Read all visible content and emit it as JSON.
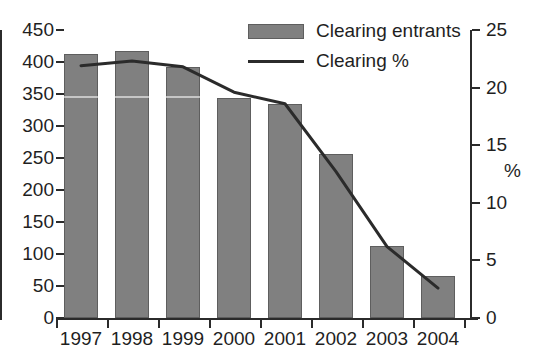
{
  "chart_data": {
    "type": "bar",
    "title": "",
    "subtitle": "",
    "xlabel": "",
    "ylabel": "",
    "grid": false,
    "legend_position": "top-right",
    "categories": [
      "1997",
      "1998",
      "1999",
      "2000",
      "2001",
      "2002",
      "2003",
      "2004"
    ],
    "series": [
      {
        "name": "Clearing entrants",
        "type": "bar",
        "axis": "left",
        "color": "#808080",
        "values": [
          412,
          417,
          392,
          344,
          334,
          257,
          113,
          66
        ]
      },
      {
        "name": "Clearing %",
        "type": "line",
        "axis": "right",
        "color": "#2b2b2b",
        "values": [
          21.9,
          22.3,
          21.8,
          19.6,
          18.6,
          12.7,
          6.2,
          2.6
        ]
      }
    ],
    "left_axis": {
      "label": "",
      "ylim": [
        0,
        450
      ],
      "tick_step": 50,
      "ticks": [
        "450",
        "400",
        "350",
        "300",
        "250",
        "200",
        "150",
        "100",
        "50",
        "0"
      ]
    },
    "right_axis": {
      "label": "%",
      "ylim": [
        0,
        25
      ],
      "tick_step": 5,
      "ticks": [
        "25",
        "20",
        "15",
        "10",
        "5",
        "0"
      ]
    }
  },
  "legend": {
    "items": [
      {
        "label": "Clearing entrants",
        "marker": "bar-swatch"
      },
      {
        "label": "Clearing %",
        "marker": "line-swatch"
      }
    ]
  }
}
